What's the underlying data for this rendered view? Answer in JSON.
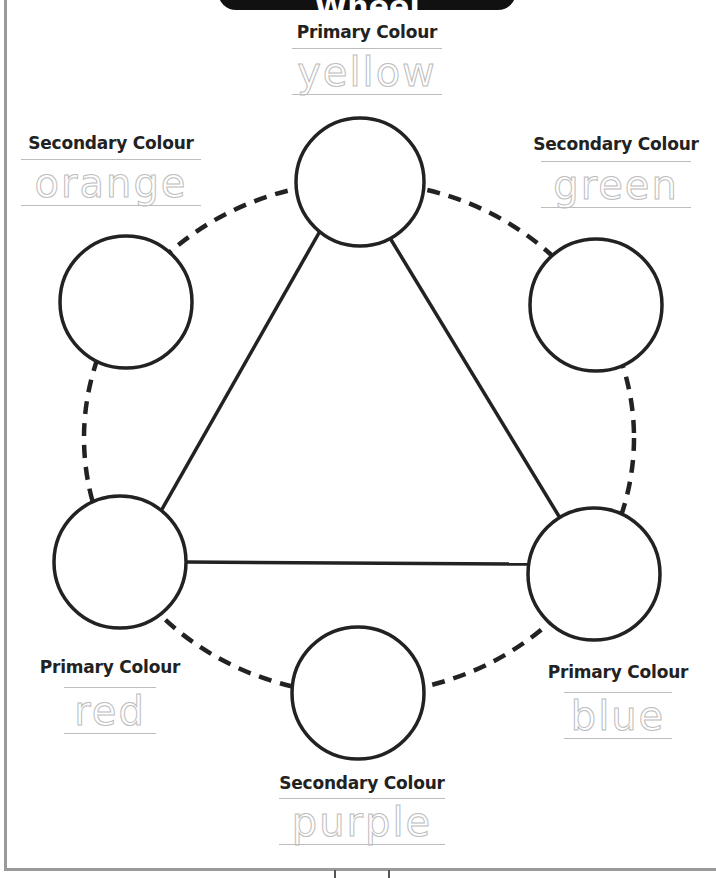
{
  "title": "The Colour Wheel",
  "colors": {
    "ink": "#222222",
    "trace": "#bdbdbd",
    "border": "#9a9a9a",
    "title_bg": "#111111"
  },
  "labels": [
    {
      "id": "yellow",
      "heading": "Primary Colour",
      "word": "yellow",
      "position": "top"
    },
    {
      "id": "orange",
      "heading": "Secondary Colour",
      "word": "orange",
      "position": "upper-left"
    },
    {
      "id": "green",
      "heading": "Secondary Colour",
      "word": "green",
      "position": "upper-right"
    },
    {
      "id": "red",
      "heading": "Primary Colour",
      "word": "red",
      "position": "lower-left"
    },
    {
      "id": "blue",
      "heading": "Primary Colour",
      "word": "blue",
      "position": "lower-right"
    },
    {
      "id": "purple",
      "heading": "Secondary Colour",
      "word": "purple",
      "position": "bottom"
    }
  ],
  "circles": [
    {
      "id": "yellow",
      "cx": 360,
      "cy": 182,
      "r": 64
    },
    {
      "id": "orange",
      "cx": 126,
      "cy": 302,
      "r": 66
    },
    {
      "id": "green",
      "cx": 596,
      "cy": 305,
      "r": 66
    },
    {
      "id": "red",
      "cx": 120,
      "cy": 562,
      "r": 66
    },
    {
      "id": "blue",
      "cx": 594,
      "cy": 574,
      "r": 66
    },
    {
      "id": "purple",
      "cx": 358,
      "cy": 693,
      "r": 66
    }
  ]
}
